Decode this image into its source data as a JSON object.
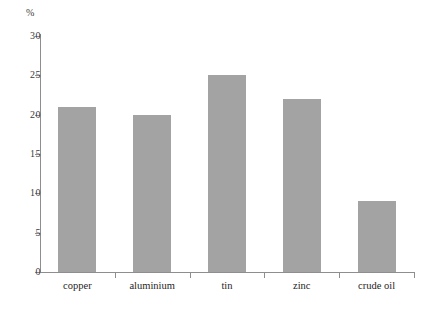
{
  "chart_data": {
    "type": "bar",
    "title": "",
    "subtitle": "",
    "xlabel": "",
    "ylabel": "%",
    "unit_caption": "%",
    "categories": [
      "copper",
      "aluminium",
      "tin",
      "zinc",
      "crude oil"
    ],
    "values": [
      21,
      20,
      25,
      22,
      9
    ],
    "ylim": [
      0,
      30
    ],
    "ytick_labels": [
      "0",
      "5",
      "10",
      "15",
      "20",
      "25",
      "30"
    ],
    "ytick_values": [
      0,
      5,
      10,
      15,
      20,
      25,
      30
    ],
    "grid": false,
    "legend": null,
    "legend_position": "none",
    "annotations": [],
    "series": [
      {
        "name": "",
        "values": [
          21,
          20,
          25,
          22,
          9
        ]
      }
    ]
  },
  "style": {
    "bar_color": "#a3a3a3",
    "axis_color": "#8e8e8e",
    "text_color": "#262523",
    "background": "#ffffff"
  }
}
